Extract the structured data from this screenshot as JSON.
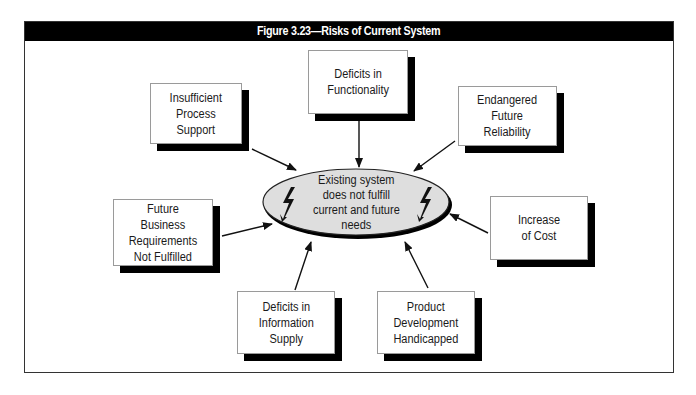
{
  "figure": {
    "title": "Figure 3.23—Risks of Current System"
  },
  "center": {
    "label": "Existing system\ndoes not fulfill\ncurrent and future\nneeds",
    "icon_left": "lightning-bolt-icon",
    "icon_right": "lightning-bolt-icon",
    "fill_color": "#dedede"
  },
  "risks": [
    {
      "id": "insufficient-process-support",
      "label": "Insufficient\nProcess\nSupport"
    },
    {
      "id": "deficits-in-functionality",
      "label": "Deficits in\nFunctionality"
    },
    {
      "id": "endangered-future-reliability",
      "label": "Endangered\nFuture\nReliability"
    },
    {
      "id": "future-business-requirements",
      "label": "Future\nBusiness\nRequirements\nNot Fulfilled"
    },
    {
      "id": "increase-of-cost",
      "label": "Increase\nof Cost"
    },
    {
      "id": "deficits-in-information-supply",
      "label": "Deficits in\nInformation\nSupply"
    },
    {
      "id": "product-development-handicapped",
      "label": "Product\nDevelopment\nHandicapped"
    }
  ],
  "colors": {
    "header_bg": "#000000",
    "header_text": "#ffffff",
    "box_shadow": "#000000",
    "ellipse_fill": "#dedede"
  }
}
